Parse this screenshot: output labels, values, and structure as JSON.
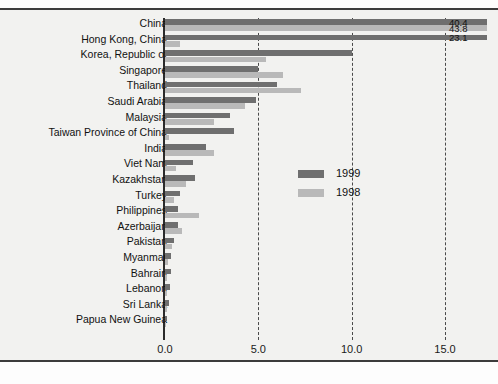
{
  "chart_data": {
    "type": "bar",
    "orientation": "horizontal",
    "title": "",
    "xlabel": "",
    "ylabel": "",
    "xlim": [
      0.0,
      15.0
    ],
    "xticks": [
      "0.0",
      "5.0",
      "10.0",
      "15.0"
    ],
    "xtick_values": [
      0.0,
      5.0,
      10.0,
      15.0
    ],
    "grid": true,
    "grid_style": "dashed vertical",
    "legend_position": "middle-right inside plot",
    "legend": [
      "1999",
      "1998"
    ],
    "colors": {
      "1999": "#6f6f6f",
      "1998": "#b9b9b9"
    },
    "note": "Bars for China and Hong Kong, China exceed the axis maximum and are clipped; their values are printed at the right edge.",
    "categories": [
      "China",
      "Hong Kong, China",
      "Korea, Republic of",
      "Singapore",
      "Thailand",
      "Saudi Arabia",
      "Malaysia",
      "Taiwan Province of China",
      "India",
      "Viet Nam",
      "Kazakhstan",
      "Turkey",
      "Philippines",
      "Azerbaijan",
      "Pakistan",
      "Myanmar",
      "Bahrain",
      "Lebanon",
      "Sri Lanka",
      "Papua New Guinea"
    ],
    "series": [
      {
        "name": "1999",
        "values": [
          40.4,
          23.1,
          10.0,
          5.0,
          6.0,
          4.9,
          3.5,
          3.7,
          2.2,
          1.5,
          1.6,
          0.8,
          0.7,
          0.7,
          0.5,
          0.3,
          0.3,
          0.25,
          0.2,
          0.1
        ]
      },
      {
        "name": "1998",
        "values": [
          43.8,
          0.8,
          5.4,
          6.3,
          7.3,
          4.3,
          2.6,
          0.2,
          2.6,
          0.6,
          1.1,
          0.5,
          1.8,
          0.9,
          0.4,
          0.15,
          0.1,
          0.1,
          0.1,
          0.05
        ]
      }
    ],
    "value_labels": [
      {
        "text": "40.4",
        "series": "1999",
        "category": "China"
      },
      {
        "text": "43.8",
        "series": "1998",
        "category": "China"
      },
      {
        "text": "23.1",
        "series": "1999",
        "category": "Hong Kong, China"
      }
    ]
  }
}
